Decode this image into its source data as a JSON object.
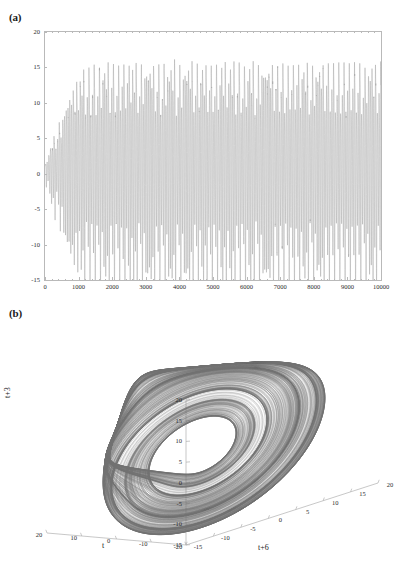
{
  "figure": {
    "panels": [
      {
        "id": "a",
        "label": "(a)"
      },
      {
        "id": "b",
        "label": "(b)"
      }
    ]
  },
  "chart_data": [
    {
      "type": "line",
      "panel": "(a)",
      "title": "",
      "xlabel": "",
      "ylabel": "",
      "xlim": [
        0,
        10000
      ],
      "ylim": [
        -15,
        20
      ],
      "grid": false,
      "legend": null,
      "line_color": "#9a9a9a",
      "xticks": [
        0,
        1000,
        2000,
        3000,
        4000,
        5000,
        6000,
        7000,
        8000,
        9000,
        10000
      ],
      "xtick_labels": [
        "0",
        "1000",
        "2000",
        "3000",
        "4000",
        "5000",
        "6000",
        "7000",
        "8000",
        "9000",
        "10000"
      ],
      "yticks": [
        20,
        15,
        10,
        5,
        0,
        -5,
        -10,
        -15
      ],
      "ytick_labels": [
        "20",
        "15",
        "10",
        "5",
        "0",
        "-5",
        "-10",
        "-15"
      ],
      "description": "Chaotic time series; oscillation amplitude grows from near zero at t=0 and saturates into a sustained chaotic regime with peaks near 17.5 and troughs near -14.",
      "series": [
        {
          "name": "x(t)",
          "envelope_upper": [
            1.2,
            5.5,
            9.0,
            13.0,
            15.5,
            16.8,
            17.3,
            17.4,
            17.5,
            17.4,
            17.5,
            17.4,
            17.5,
            17.3,
            17.5,
            17.4,
            17.5,
            17.4,
            17.5,
            17.4,
            17.3
          ],
          "envelope_lower": [
            -1.0,
            -4.5,
            -7.5,
            -10.5,
            -12.5,
            -13.3,
            -13.7,
            -13.8,
            -13.9,
            -13.8,
            -13.9,
            -13.8,
            -13.9,
            -13.7,
            -13.9,
            -13.8,
            -13.9,
            -13.8,
            -13.9,
            -13.7,
            -13.6
          ],
          "envelope_x": [
            0,
            250,
            500,
            750,
            1000,
            1250,
            1500,
            2000,
            2500,
            3000,
            3500,
            4000,
            4500,
            5000,
            5500,
            6000,
            6500,
            7000,
            7500,
            8000,
            10000
          ],
          "mean_level": 1.0,
          "dominant_period_samples": 52
        }
      ]
    },
    {
      "type": "scatter",
      "panel": "(b)",
      "title": "",
      "projection": "3d",
      "xlabel": "t",
      "ylabel": "t+6",
      "zlabel": "t+3",
      "grid": false,
      "legend": null,
      "line_color": "#707070",
      "description": "Three-dimensional delay-coordinate phase-space reconstruction of the time series in panel (a), using delays of 3 and 6 samples. The trajectory forms a Roessler-type single-scroll chaotic attractor with a dense outer band of orbits spiralling inward to a tight core and a folding branch on the lower-left.",
      "axes": [
        {
          "name": "t",
          "label": "t",
          "lim": [
            -20,
            20
          ],
          "ticks": [
            20,
            10,
            0,
            -10,
            -20
          ],
          "tick_labels": [
            "20",
            "10",
            "0",
            "-10",
            "-20"
          ]
        },
        {
          "name": "t+6",
          "label": "t+6",
          "lim": [
            -15,
            20
          ],
          "ticks": [
            -15,
            -10,
            -5,
            0,
            5,
            10,
            15,
            20
          ],
          "tick_labels": [
            "-15",
            "-10",
            "-5",
            "0",
            "5",
            "10",
            "15",
            "20"
          ]
        },
        {
          "name": "t+3",
          "label": "t+3",
          "lim": [
            -15,
            20
          ],
          "ticks": [
            20,
            15,
            10,
            5,
            0,
            -5,
            -10,
            -15
          ],
          "tick_labels": [
            "20",
            "15",
            "10",
            "5",
            "0",
            "-5",
            "-10",
            "-15"
          ]
        }
      ]
    }
  ],
  "colors": {
    "trace": "#9a9a9a",
    "attractor": "#707070",
    "axis": "#b9b9b9",
    "text": "#1a1a1a",
    "background": "#ffffff"
  }
}
